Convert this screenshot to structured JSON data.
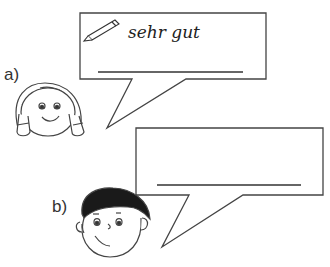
{
  "exercise": {
    "items": [
      {
        "label": "a)",
        "character": "girl",
        "bubble_text": "sehr gut",
        "has_pencil": true,
        "answer_line": ""
      },
      {
        "label": "b)",
        "character": "boy",
        "bubble_text": "",
        "has_pencil": false,
        "answer_line": ""
      }
    ]
  },
  "colors": {
    "stroke": "#444444",
    "hair_boy": "#1a1a1a",
    "background": "#ffffff"
  }
}
